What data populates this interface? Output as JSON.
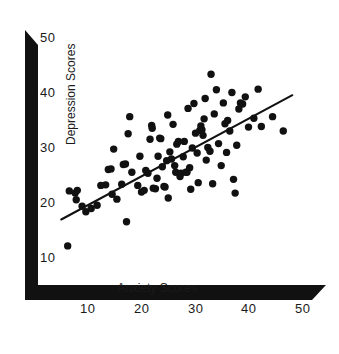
{
  "chart_data": {
    "type": "scatter",
    "title": "",
    "xlabel": "Anxiety Scores",
    "ylabel": "Depression Scores",
    "xlim": [
      4,
      52
    ],
    "ylim": [
      8,
      52
    ],
    "xticks": [
      10,
      20,
      30,
      40,
      50
    ],
    "yticks": [
      10,
      20,
      30,
      40,
      50
    ],
    "xtick_labels": [
      "10",
      "20",
      "30",
      "40",
      "50"
    ],
    "ytick_labels": [
      "10",
      "20",
      "30",
      "40",
      "50"
    ],
    "grid": false,
    "legend": null,
    "marker_color": "#111111",
    "marker_size": 5,
    "axis_color": "#111111",
    "series": [
      {
        "name": "Anxiety vs Depression",
        "points": [
          [
            6.2,
            12.2
          ],
          [
            6.5,
            22.2
          ],
          [
            7.6,
            21.8
          ],
          [
            7.8,
            20.6
          ],
          [
            8.0,
            22.3
          ],
          [
            8.9,
            19.4
          ],
          [
            9.6,
            18.4
          ],
          [
            10.6,
            19.0
          ],
          [
            11.7,
            19.6
          ],
          [
            12.4,
            23.2
          ],
          [
            13.3,
            23.3
          ],
          [
            13.8,
            26.1
          ],
          [
            14.3,
            26.2
          ],
          [
            14.5,
            21.6
          ],
          [
            14.8,
            29.8
          ],
          [
            15.4,
            20.7
          ],
          [
            16.3,
            23.4
          ],
          [
            16.6,
            27.0
          ],
          [
            17.0,
            27.1
          ],
          [
            17.2,
            16.6
          ],
          [
            17.5,
            32.6
          ],
          [
            17.8,
            35.7
          ],
          [
            18.2,
            25.6
          ],
          [
            19.3,
            23.2
          ],
          [
            19.7,
            28.5
          ],
          [
            20.0,
            22.0
          ],
          [
            20.5,
            22.3
          ],
          [
            20.8,
            25.9
          ],
          [
            21.2,
            25.4
          ],
          [
            21.6,
            31.6
          ],
          [
            21.9,
            34.1
          ],
          [
            22.0,
            33.6
          ],
          [
            22.2,
            22.7
          ],
          [
            22.6,
            22.6
          ],
          [
            22.9,
            24.5
          ],
          [
            23.1,
            28.5
          ],
          [
            23.4,
            31.8
          ],
          [
            23.6,
            31.7
          ],
          [
            23.9,
            26.6
          ],
          [
            24.2,
            23.0
          ],
          [
            24.4,
            22.9
          ],
          [
            24.7,
            27.7
          ],
          [
            24.9,
            36.0
          ],
          [
            25.0,
            20.9
          ],
          [
            25.3,
            29.3
          ],
          [
            25.6,
            28.0
          ],
          [
            25.9,
            34.3
          ],
          [
            26.2,
            26.8
          ],
          [
            26.4,
            25.6
          ],
          [
            26.6,
            30.7
          ],
          [
            26.9,
            31.2
          ],
          [
            27.2,
            24.8
          ],
          [
            27.4,
            25.4
          ],
          [
            27.8,
            28.4
          ],
          [
            28.0,
            31.2
          ],
          [
            28.3,
            25.6
          ],
          [
            28.5,
            25.6
          ],
          [
            28.7,
            37.2
          ],
          [
            29.0,
            26.4
          ],
          [
            29.2,
            22.5
          ],
          [
            29.5,
            30.0
          ],
          [
            29.8,
            38.1
          ],
          [
            30.1,
            32.7
          ],
          [
            30.4,
            29.1
          ],
          [
            30.6,
            23.7
          ],
          [
            30.9,
            33.2
          ],
          [
            31.1,
            34.0
          ],
          [
            31.3,
            33.3
          ],
          [
            31.5,
            32.3
          ],
          [
            31.7,
            35.3
          ],
          [
            31.9,
            39.0
          ],
          [
            32.1,
            27.8
          ],
          [
            32.4,
            30.1
          ],
          [
            32.8,
            29.4
          ],
          [
            33.0,
            43.4
          ],
          [
            33.3,
            23.5
          ],
          [
            33.6,
            36.2
          ],
          [
            34.0,
            40.6
          ],
          [
            34.4,
            30.8
          ],
          [
            34.9,
            26.8
          ],
          [
            35.3,
            38.2
          ],
          [
            35.6,
            34.4
          ],
          [
            35.9,
            29.2
          ],
          [
            36.1,
            35.0
          ],
          [
            36.5,
            33.1
          ],
          [
            36.9,
            40.1
          ],
          [
            37.2,
            24.3
          ],
          [
            37.5,
            21.8
          ],
          [
            37.8,
            30.5
          ],
          [
            38.2,
            37.1
          ],
          [
            38.5,
            38.2
          ],
          [
            38.9,
            38.0
          ],
          [
            39.4,
            39.3
          ],
          [
            40.0,
            33.8
          ],
          [
            41.0,
            35.4
          ],
          [
            41.8,
            40.7
          ],
          [
            42.4,
            33.9
          ],
          [
            44.5,
            35.7
          ],
          [
            46.5,
            33.1
          ]
        ]
      }
    ],
    "trendline": {
      "name": "regression-line",
      "x_start": 5.0,
      "y_start": 17.0,
      "x_end": 48.2,
      "y_end": 39.6,
      "color": "#111111",
      "width": 2
    }
  },
  "axes": {
    "x_title": "Anxiety Scores",
    "y_title": "Depression Scores",
    "x_ticks": [
      "10",
      "20",
      "30",
      "40",
      "50"
    ],
    "y_ticks": [
      "50",
      "40",
      "30",
      "20",
      "10"
    ]
  }
}
